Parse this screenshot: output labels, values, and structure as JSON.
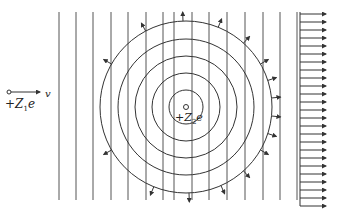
{
  "figure": {
    "incoming_particle": {
      "charge_label": "+Z",
      "charge_sub": "1",
      "charge_suffix": "e",
      "velocity_label": "v"
    },
    "target_nucleus": {
      "charge_label": "+Z",
      "charge_sub": "2",
      "charge_suffix": "e"
    },
    "vertical_lines_x": [
      59,
      76,
      93,
      111,
      128,
      146,
      163,
      174,
      192,
      209,
      227,
      245,
      263,
      280,
      297
    ],
    "circle_center": [
      186,
      107
    ],
    "circle_radii": [
      17,
      34,
      51,
      68,
      86
    ],
    "arrow_column_x": 314,
    "colors": {
      "line": "#333333",
      "background": "#ffffff"
    }
  }
}
